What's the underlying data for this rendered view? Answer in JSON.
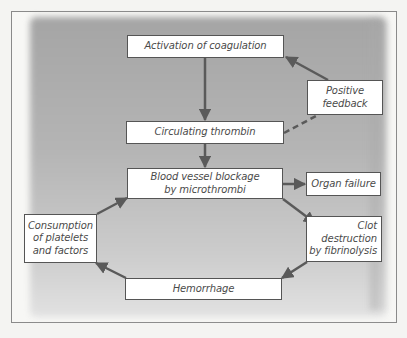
{
  "diagram": {
    "title_fragment": "",
    "nodes": {
      "activation": {
        "label": "Activation of coagulation"
      },
      "positive_feedback": {
        "label": "Positive\nfeedback"
      },
      "circulating_thrombin": {
        "label": "Circulating thrombin"
      },
      "blood_vessel_blockage": {
        "label": "Blood vessel blockage\nby microthrombi"
      },
      "organ_failure": {
        "label": "Organ failure"
      },
      "clot_destruction": {
        "label": "Clot\ndestruction\nby fibrinolysis"
      },
      "hemorrhage": {
        "label": "Hemorrhage"
      },
      "consumption": {
        "label": "Consumption\nof platelets\nand factors"
      }
    },
    "edges": [
      {
        "from": "activation",
        "to": "circulating_thrombin",
        "style": "solid"
      },
      {
        "from": "circulating_thrombin",
        "to": "blood_vessel_blockage",
        "style": "solid"
      },
      {
        "from": "circulating_thrombin",
        "to": "positive_feedback",
        "style": "dashed"
      },
      {
        "from": "positive_feedback",
        "to": "activation",
        "style": "solid"
      },
      {
        "from": "blood_vessel_blockage",
        "to": "organ_failure",
        "style": "solid"
      },
      {
        "from": "blood_vessel_blockage",
        "to": "clot_destruction",
        "style": "solid"
      },
      {
        "from": "clot_destruction",
        "to": "hemorrhage",
        "style": "solid"
      },
      {
        "from": "hemorrhage",
        "to": "consumption",
        "style": "solid"
      },
      {
        "from": "consumption",
        "to": "blood_vessel_blockage",
        "style": "solid"
      }
    ],
    "colors": {
      "arrow": "#5a5a5a",
      "box_border": "#555555",
      "box_fill": "#ffffff",
      "background_shade": "#a8a8a8",
      "text": "#4a4a4a"
    }
  }
}
